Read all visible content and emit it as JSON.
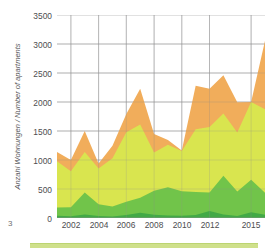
{
  "page": {
    "page_number": "3",
    "background": "#ffffff"
  },
  "axis": {
    "ylabel": "Anzahl Wohnungen / Number of apartments",
    "ytick_labels": [
      "0",
      "500",
      "1000",
      "1500",
      "2000",
      "2500",
      "3000",
      "3500"
    ],
    "xtick_labels": [
      "2002",
      "2004",
      "2006",
      "2008",
      "2010",
      "2012",
      "2015"
    ],
    "grid_color": "#9a9a9c",
    "tick_color": "#4d4d4f"
  },
  "legend_strip": {
    "color": "#cfe08b"
  },
  "chart_data": {
    "type": "area",
    "stacked": true,
    "title": "",
    "xlabel": "",
    "ylabel": "Anzahl Wohnungen / Number of apartments",
    "ylim": [
      0,
      3500
    ],
    "yticks": [
      0,
      500,
      1000,
      1500,
      2000,
      2500,
      3000,
      3500
    ],
    "xticks": [
      2002,
      2004,
      2006,
      2008,
      2010,
      2012,
      2015
    ],
    "grid": true,
    "legend": "none",
    "x": [
      2001,
      2002,
      2003,
      2004,
      2005,
      2006,
      2007,
      2008,
      2009,
      2010,
      2011,
      2012,
      2013,
      2014,
      2015,
      2016
    ],
    "series": [
      {
        "name": "series-1-dark-green",
        "color": "#3fa846",
        "values": [
          40,
          30,
          60,
          35,
          25,
          50,
          90,
          55,
          45,
          40,
          50,
          120,
          60,
          35,
          100,
          55
        ]
      },
      {
        "name": "series-2-medium-green",
        "color": "#6cc24a",
        "values": [
          140,
          155,
          380,
          200,
          175,
          230,
          260,
          415,
          485,
          420,
          400,
          320,
          670,
          420,
          560,
          380
        ]
      },
      {
        "name": "series-3-yellow-green",
        "color": "#d7e84f",
        "values": [
          800,
          620,
          700,
          620,
          830,
          1200,
          1260,
          660,
          735,
          695,
          1080,
          1130,
          1070,
          1020,
          1340,
          1440
        ]
      },
      {
        "name": "series-4-orange",
        "color": "#f0a952",
        "values": [
          160,
          195,
          360,
          85,
          215,
          315,
          620,
          320,
          80,
          10,
          750,
          660,
          660,
          520,
          0,
          1180
        ]
      }
    ],
    "stack_totals": [
      1140,
      1000,
      1500,
      940,
      1245,
      1795,
      2230,
      1450,
      1345,
      1165,
      2280,
      2230,
      2460,
      1995,
      2000,
      3055
    ]
  }
}
